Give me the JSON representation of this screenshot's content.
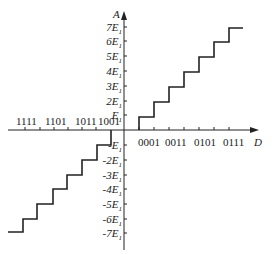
{
  "axes": {
    "x_label": "D",
    "y_label": "A"
  },
  "x_ticks_positive": [
    "0001",
    "0011",
    "0101",
    "0111"
  ],
  "x_ticks_negative": [
    "1001",
    "1011",
    "1101",
    "1111"
  ],
  "y_ticks_positive": [
    "E",
    "2E",
    "3E",
    "4E",
    "5E",
    "6E",
    "7E"
  ],
  "y_ticks_negative": [
    "-E",
    "-2E",
    "-3E",
    "-4E",
    "-5E",
    "-6E",
    "-7E"
  ],
  "y_tick_subscript": "1",
  "colors": {
    "line": "#222222",
    "background": "#ffffff"
  }
}
